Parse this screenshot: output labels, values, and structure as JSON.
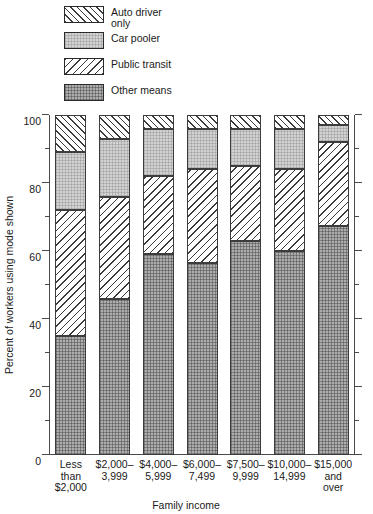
{
  "chart_data": {
    "type": "bar",
    "subtype": "stacked-bar",
    "title": "",
    "xlabel": "Family income",
    "ylabel": "Percent of workers using mode shown",
    "ylim": [
      0,
      100
    ],
    "ytick_labels": [
      "0",
      "20",
      "40",
      "60",
      "80",
      "100"
    ],
    "ytick_values": [
      0,
      20,
      40,
      60,
      80,
      100
    ],
    "yminor_values": [
      10,
      30,
      50,
      70,
      90
    ],
    "grid": false,
    "legend_position": "top-left",
    "stack_order_bottom_to_top": [
      "Other means",
      "Public transit",
      "Car pooler",
      "Auto driver only"
    ],
    "categories": [
      "Less\nthan\n$2,000",
      "$2,000–\n3,999",
      "$4,000–\n5,999",
      "$6,000–\n7,499",
      "$7,500–\n9,999",
      "$10,000–\n14,999",
      "$15,000\nand\nover"
    ],
    "series": [
      {
        "name": "Other means",
        "pattern": "other",
        "values": [
          35,
          46,
          59,
          56.5,
          63,
          60,
          67.5
        ]
      },
      {
        "name": "Public transit",
        "pattern": "transit",
        "values": [
          37,
          30,
          23,
          27.5,
          22,
          24,
          24.5
        ]
      },
      {
        "name": "Car pooler",
        "pattern": "pool",
        "values": [
          17,
          17,
          14,
          12,
          11,
          12,
          5
        ]
      },
      {
        "name": "Auto driver only",
        "pattern": "auto",
        "values": [
          11,
          7,
          4,
          4,
          4,
          4,
          3
        ]
      }
    ],
    "cumulative_tops": [
      [
        35,
        72,
        89,
        100
      ],
      [
        46,
        76,
        93,
        100
      ],
      [
        59,
        82,
        96,
        100
      ],
      [
        56.5,
        84,
        96,
        100
      ],
      [
        63,
        85,
        96,
        100
      ],
      [
        60,
        84,
        96,
        100
      ],
      [
        67.5,
        92,
        97,
        100
      ]
    ]
  },
  "legend": {
    "items": [
      {
        "label": "Auto driver\nonly",
        "pattern": "auto"
      },
      {
        "label": "Car pooler",
        "pattern": "pool"
      },
      {
        "label": "Public transit",
        "pattern": "transit"
      },
      {
        "label": "Other means",
        "pattern": "other"
      }
    ]
  },
  "colors": {
    "auto_driver_only": "#ffffff",
    "car_pooler": "#d2d2d2",
    "public_transit": "#ffffff",
    "other_means": "#adadad",
    "line": "#3c3c3c",
    "text": "#1a1a1a"
  }
}
